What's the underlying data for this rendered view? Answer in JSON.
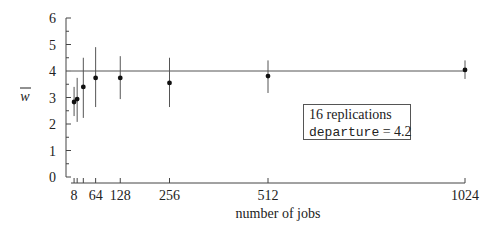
{
  "chart_data": {
    "type": "scatter",
    "title": "",
    "xlabel": "number of jobs",
    "ylabel": "w̄",
    "ylim": [
      0,
      6
    ],
    "xlim": [
      0,
      1024
    ],
    "grid": false,
    "x_ticks": [
      8,
      16,
      32,
      64,
      128,
      256,
      512,
      1024
    ],
    "x_tick_labels": [
      "8",
      "",
      "",
      "64",
      "128",
      "256",
      "512",
      "1024"
    ],
    "y_ticks": [
      0,
      1,
      2,
      3,
      4,
      5,
      6
    ],
    "y_tick_labels": [
      "0",
      "1",
      "2",
      "3",
      "4",
      "5",
      "6"
    ],
    "reference_line": {
      "y": 4.0,
      "x_from": 0,
      "x_to": 1024
    },
    "series": [
      {
        "name": "mean w with error bars",
        "x": [
          8,
          16,
          32,
          64,
          128,
          256,
          512,
          1024
        ],
        "y": [
          2.83,
          2.94,
          3.4,
          3.74,
          3.74,
          3.55,
          3.81,
          4.04
        ],
        "err_low": [
          2.3,
          2.08,
          2.23,
          2.64,
          2.94,
          2.64,
          3.17,
          3.7
        ],
        "err_high": [
          3.4,
          3.74,
          4.5,
          4.9,
          4.56,
          4.5,
          4.4,
          4.4
        ]
      }
    ],
    "annotation": {
      "line1": "16 replications",
      "line2_code": "departure",
      "line2_rest": " = 4.2"
    },
    "legend_position": "inside right-middle"
  }
}
